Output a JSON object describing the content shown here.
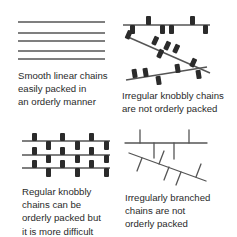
{
  "colors": {
    "line": "#555555",
    "knob": "#2b2b2b",
    "text": "#2a2a2a",
    "background": "#ffffff"
  },
  "panels": [
    {
      "id": "smooth-linear",
      "caption": "Smooth linear chains\neasily packed in\nan orderly manner"
    },
    {
      "id": "irregular-knobbly",
      "caption": "Irregular knobbly chains\nare not orderly packed"
    },
    {
      "id": "regular-knobbly",
      "caption": "Regular knobbly\nchains can be\norderly packed but\nit is more difficult"
    },
    {
      "id": "irregularly-branched",
      "caption": "Irregularly branched\nchains are not\norderly packed"
    }
  ]
}
